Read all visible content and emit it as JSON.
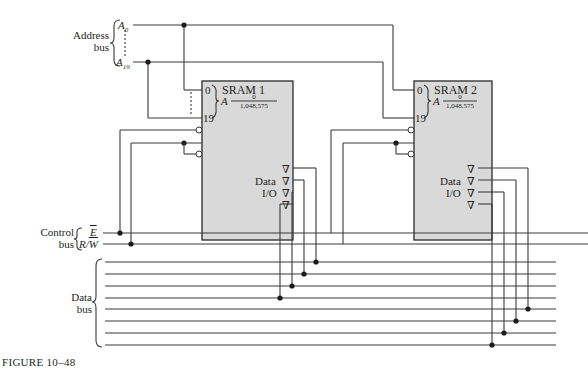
{
  "figure": {
    "caption": "FIGURE 10–48"
  },
  "address_bus": {
    "label_line1": "Address",
    "label_line2": "bus",
    "top_signal": "A",
    "top_sub": "0",
    "bottom_signal": "A",
    "bottom_sub": "19"
  },
  "control_bus": {
    "label_line1": "Control",
    "label_line2": "bus",
    "enable_signal": "E",
    "rw_prefix": "R/",
    "rw_signal": "W"
  },
  "data_bus": {
    "label_line1": "Data",
    "label_line2": "bus",
    "line_count": 8
  },
  "chips": [
    {
      "name": "SRAM 1",
      "pin_top": "0",
      "pin_bottom": "19",
      "address_letter": "A",
      "range_top": "0",
      "range_bottom": "1,048,575",
      "data_label": "Data",
      "io_label": "I/O",
      "tri_state_symbol": "∇"
    },
    {
      "name": "SRAM 2",
      "pin_top": "0",
      "pin_bottom": "19",
      "address_letter": "A",
      "range_top": "0",
      "range_bottom": "1,048,575",
      "data_label": "Data",
      "io_label": "I/O",
      "tri_state_symbol": "∇"
    }
  ]
}
